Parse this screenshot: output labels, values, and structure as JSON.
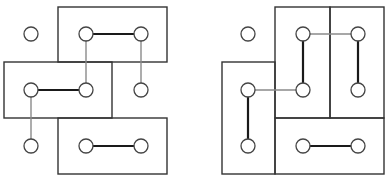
{
  "diagrams": [
    {
      "name": "left-diagram",
      "rects": [
        {
          "x": 58,
          "y": 7,
          "w": 109,
          "h": 55
        },
        {
          "x": 4,
          "y": 62,
          "w": 108,
          "h": 56
        },
        {
          "x": 58,
          "y": 118,
          "w": 109,
          "h": 56
        }
      ],
      "nodes": [
        {
          "cx": 31,
          "cy": 34
        },
        {
          "cx": 86,
          "cy": 34
        },
        {
          "cx": 141,
          "cy": 34
        },
        {
          "cx": 31,
          "cy": 90
        },
        {
          "cx": 86,
          "cy": 90
        },
        {
          "cx": 141,
          "cy": 90
        },
        {
          "cx": 31,
          "cy": 146
        },
        {
          "cx": 86,
          "cy": 146
        },
        {
          "cx": 141,
          "cy": 146
        }
      ],
      "thick_edges": [
        [
          86,
          34,
          141,
          34
        ],
        [
          31,
          90,
          86,
          90
        ],
        [
          86,
          146,
          141,
          146
        ]
      ],
      "thin_edges": [
        [
          86,
          34,
          86,
          90
        ],
        [
          141,
          34,
          141,
          90
        ],
        [
          31,
          90,
          31,
          146
        ]
      ]
    },
    {
      "name": "right-diagram",
      "rects": [
        {
          "x": 222,
          "y": 62,
          "w": 53,
          "h": 112
        },
        {
          "x": 275,
          "y": 7,
          "w": 55,
          "h": 111
        },
        {
          "x": 330,
          "y": 7,
          "w": 54,
          "h": 111
        },
        {
          "x": 275,
          "y": 118,
          "w": 109,
          "h": 56
        }
      ],
      "nodes": [
        {
          "cx": 248,
          "cy": 34
        },
        {
          "cx": 303,
          "cy": 34
        },
        {
          "cx": 358,
          "cy": 34
        },
        {
          "cx": 248,
          "cy": 90
        },
        {
          "cx": 303,
          "cy": 90
        },
        {
          "cx": 358,
          "cy": 90
        },
        {
          "cx": 248,
          "cy": 146
        },
        {
          "cx": 303,
          "cy": 146
        },
        {
          "cx": 358,
          "cy": 146
        }
      ],
      "thick_edges": [
        [
          303,
          34,
          303,
          90
        ],
        [
          358,
          34,
          358,
          90
        ],
        [
          248,
          90,
          248,
          146
        ],
        [
          303,
          146,
          358,
          146
        ]
      ],
      "thin_edges": [
        [
          303,
          34,
          358,
          34
        ],
        [
          248,
          90,
          303,
          90
        ]
      ]
    }
  ],
  "colors": {
    "rect_stroke": "#333333",
    "thick_edge": "#1a1a1a",
    "thin_edge": "#8a8a8a",
    "node_fill": "#ffffff",
    "node_stroke": "#444444"
  },
  "node_radius": 7
}
